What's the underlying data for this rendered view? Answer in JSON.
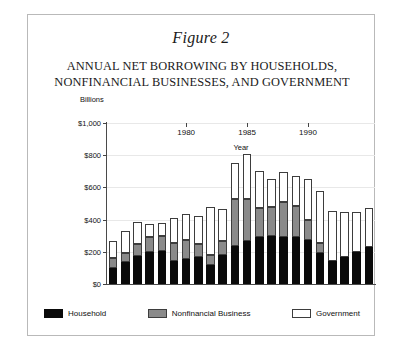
{
  "figure": {
    "number_label": "Figure 2",
    "title_line1": "ANNUAL NET BORROWING BY HOUSEHOLDS,",
    "title_line2": "NONFINANCIAL BUSINESSES, AND GOVERNMENT"
  },
  "colors": {
    "household": "#0a0a0a",
    "business": "#8a8a8a",
    "government": "#ffffff",
    "outline": "#3d3d3d",
    "axis": "#4a4a4a",
    "grid": "#e8e8e8",
    "frame": "#b9b9b9"
  },
  "legend": {
    "items": [
      {
        "label": "Household",
        "swatch": "household-swatch"
      },
      {
        "label": "Nonfinancial Business",
        "swatch": "business-swatch"
      },
      {
        "label": "Government",
        "swatch": "government-swatch"
      }
    ]
  },
  "chart_data": {
    "type": "bar",
    "subtype": "stacked",
    "title": "ANNUAL NET BORROWING BY HOUSEHOLDS, NONFINANCIAL BUSINESSES, AND GOVERNMENT",
    "unit_label": "Billions",
    "xlabel": "Year",
    "ylabel": "",
    "ylim": [
      0,
      1000
    ],
    "yticks": [
      0,
      200,
      400,
      600,
      800,
      1000
    ],
    "ytick_labels": [
      "$0",
      "$200",
      "$400",
      "$600",
      "$800",
      "$1,000"
    ],
    "grid": true,
    "legend_position": "bottom",
    "categories": [
      1974,
      1975,
      1976,
      1977,
      1978,
      1979,
      1980,
      1981,
      1982,
      1983,
      1984,
      1985,
      1986,
      1987,
      1988,
      1989,
      1990,
      1991,
      1992,
      1993,
      1994,
      1995
    ],
    "xticks": [
      1980,
      1985,
      1990
    ],
    "xtick_labels": [
      "1980",
      "1985",
      "1990"
    ],
    "series": [
      {
        "name": "Household",
        "color": "#0a0a0a",
        "values": [
          100,
          135,
          175,
          200,
          205,
          145,
          155,
          165,
          120,
          180,
          235,
          270,
          290,
          300,
          295,
          290,
          275,
          195,
          145,
          170,
          200,
          230
        ]
      },
      {
        "name": "Nonfinancial Business",
        "color": "#8a8a8a",
        "values": [
          60,
          60,
          75,
          90,
          95,
          110,
          120,
          85,
          60,
          85,
          290,
          260,
          185,
          180,
          215,
          195,
          125,
          60,
          -25,
          0,
          0,
          0
        ]
      },
      {
        "name": "Government",
        "color": "#ffffff",
        "values": [
          105,
          135,
          135,
          85,
          80,
          155,
          160,
          175,
          300,
          200,
          225,
          280,
          230,
          175,
          185,
          185,
          255,
          325,
          310,
          280,
          250,
          240
        ]
      }
    ]
  }
}
